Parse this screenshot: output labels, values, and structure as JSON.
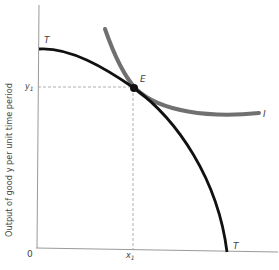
{
  "figure": {
    "y_axis_label": "Output of good y per unit time period",
    "origin_label": "0",
    "curves": {
      "transformation_curve": {
        "label_top": "T",
        "label_bottom": "T",
        "color": "#111111"
      },
      "indifference_curve": {
        "label": "I",
        "color": "#707070"
      }
    },
    "point": {
      "label": "E"
    },
    "ticks": {
      "y1_main": "y",
      "y1_sub": "1",
      "x1_main": "x",
      "x1_sub": "1"
    }
  },
  "colors": {
    "axis": "#9a9a9a",
    "dashed": "#9a9a9a",
    "t_curve": "#111111",
    "i_curve": "#707070",
    "text": "#444444"
  }
}
